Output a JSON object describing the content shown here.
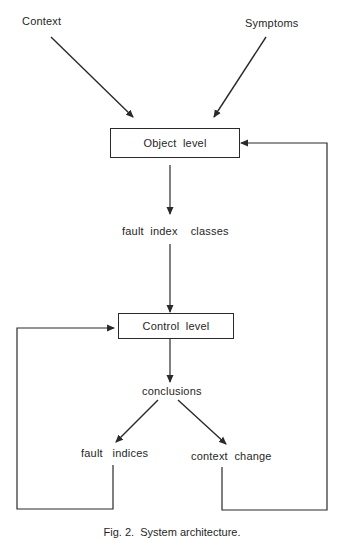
{
  "diagram": {
    "inputs": {
      "context": "Context",
      "symptoms": "Symptoms"
    },
    "nodes": {
      "object_level": "Object  level",
      "fault_index_classes": "fault  index    classes",
      "control_level": "Control  level",
      "conclusions": "conclusions",
      "fault_indices": "fault   indices",
      "context_change": "context  change"
    },
    "edges": [
      {
        "from": "Context",
        "to": "Object level"
      },
      {
        "from": "Symptoms",
        "to": "Object level"
      },
      {
        "from": "Object level",
        "to": "fault index classes"
      },
      {
        "from": "fault index classes",
        "to": "Control level"
      },
      {
        "from": "Control level",
        "to": "conclusions"
      },
      {
        "from": "conclusions",
        "to": "fault indices"
      },
      {
        "from": "conclusions",
        "to": "context change"
      },
      {
        "from": "fault indices",
        "to": "Control level",
        "type": "feedback-loop"
      },
      {
        "from": "context change",
        "to": "Object level",
        "type": "feedback-loop"
      }
    ],
    "caption": "Fig. 2.  System architecture."
  },
  "colors": {
    "line": "#2a2a2a",
    "text": "#1f1f1f",
    "background": "#ffffff"
  }
}
